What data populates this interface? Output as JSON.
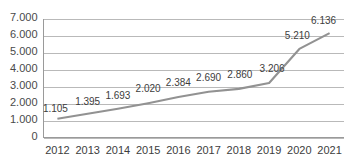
{
  "chart_data": {
    "type": "line",
    "title": "",
    "subtitle": "",
    "xlabel": "",
    "ylabel": "",
    "categories": [
      "2012",
      "2013",
      "2014",
      "2015",
      "2016",
      "2017",
      "2018",
      "2019",
      "2020",
      "2021"
    ],
    "values": [
      1105,
      1395,
      1693,
      2020,
      2384,
      2690,
      2860,
      3206,
      5210,
      6136
    ],
    "data_labels": [
      "1.105",
      "1.395",
      "1.693",
      "2.020",
      "2.384",
      "2.690",
      "2.860",
      "3.206",
      "5.210",
      "6.136"
    ],
    "series": [
      {
        "name": "",
        "values": [
          1105,
          1395,
          1693,
          2020,
          2384,
          2690,
          2860,
          3206,
          5210,
          6136
        ],
        "color": "#929292"
      }
    ],
    "ylim": [
      0,
      7000
    ],
    "ytick_values": [
      0,
      1000,
      2000,
      3000,
      4000,
      5000,
      6000,
      7000
    ],
    "ytick_labels": [
      "0",
      "1.000",
      "2.000",
      "3.000",
      "4.000",
      "5.000",
      "6.000",
      "7.000"
    ],
    "grid": true,
    "grid_axis": "y",
    "legend": false,
    "legend_position": "none",
    "markers": false,
    "colors": {
      "line": "#929292",
      "gridline": "#b9b9b9",
      "axis": "#9a9a9a",
      "tick_text": "#3d3d3d",
      "label_text": "#3d3d3d",
      "background": "#ffffff"
    }
  }
}
